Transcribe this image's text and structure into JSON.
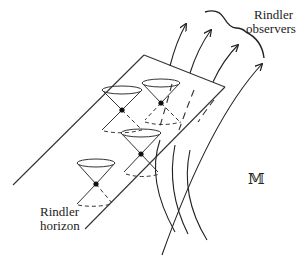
{
  "figure": {
    "labels": {
      "observers_line1": "Rindler",
      "observers_line2": "observers",
      "horizon_line1": "Rindler",
      "horizon_line2": "horizon",
      "manifold": "𝕄"
    },
    "elements": {
      "plane": "Rindler horizon plane (null hypersurface)",
      "worldlines_count": 4,
      "light_cones_count": 4
    },
    "colors": {
      "ink": "#222222",
      "background": "#ffffff"
    }
  }
}
